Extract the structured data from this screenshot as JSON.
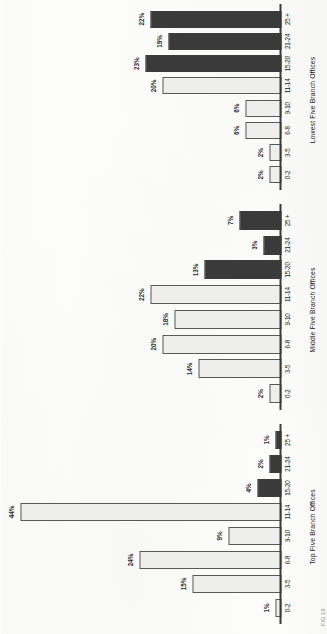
{
  "page": {
    "caption": "FIG 10"
  },
  "chart_data": [
    {
      "type": "bar",
      "title": "Top Five Branch Offices",
      "xlabel": "",
      "ylabel": "",
      "ylim": [
        0,
        46
      ],
      "grid": false,
      "legend": "none",
      "categories": [
        "0-2",
        "3-5",
        "6-8",
        "9-10",
        "11-14",
        "15-20",
        "21-24",
        "25 +"
      ],
      "values": [
        1,
        15,
        24,
        9,
        44,
        4,
        2,
        1
      ],
      "value_labels": [
        "1%",
        "15%",
        "24%",
        "9%",
        "44%",
        "4%",
        "2%",
        "1%"
      ],
      "shades": [
        "light",
        "light",
        "light",
        "light",
        "light",
        "dark",
        "dark",
        "dark"
      ]
    },
    {
      "type": "bar",
      "title": "Middle Five Branch Offices",
      "xlabel": "",
      "ylabel": "",
      "ylim": [
        0,
        46
      ],
      "grid": false,
      "legend": "none",
      "categories": [
        "0-2",
        "3-5",
        "6-8",
        "9-10",
        "11-14",
        "15-20",
        "21-24",
        "25 +"
      ],
      "values": [
        2,
        14,
        20,
        18,
        22,
        13,
        3,
        7
      ],
      "value_labels": [
        "2%",
        "14%",
        "20%",
        "18%",
        "22%",
        "13%",
        "3%",
        "7%"
      ],
      "shades": [
        "light",
        "light",
        "light",
        "light",
        "light",
        "dark",
        "dark",
        "dark"
      ]
    },
    {
      "type": "bar",
      "title": "Lowest Five Branch Offices",
      "xlabel": "",
      "ylabel": "",
      "ylim": [
        0,
        46
      ],
      "grid": false,
      "legend": "none",
      "categories": [
        "0-2",
        "3-5",
        "6-8",
        "9-10",
        "11-14",
        "15-20",
        "21-24",
        "25 +"
      ],
      "values": [
        2,
        2,
        6,
        6,
        20,
        23,
        19,
        22
      ],
      "value_labels": [
        "2%",
        "2%",
        "6%",
        "6%",
        "20%",
        "23%",
        "19%",
        "22%"
      ],
      "shades": [
        "light",
        "light",
        "light",
        "light",
        "light",
        "dark",
        "dark",
        "dark"
      ]
    }
  ]
}
